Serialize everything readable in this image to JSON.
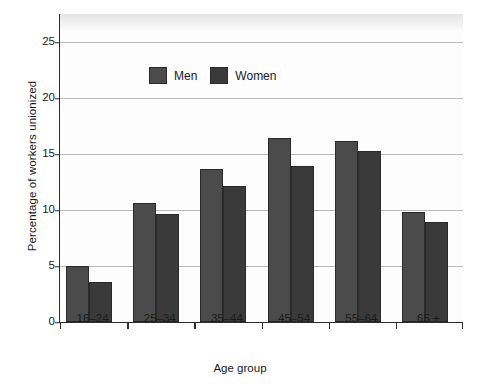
{
  "chart_data": {
    "type": "bar",
    "title": "",
    "xlabel": "Age group",
    "ylabel": "Percentage of workers unionized",
    "categories": [
      "16–24",
      "25–34",
      "35–44",
      "45–54",
      "55–64",
      "65 +"
    ],
    "series": [
      {
        "name": "Men",
        "color": "#4b4b4b",
        "values": [
          5.0,
          10.6,
          13.7,
          16.4,
          16.2,
          9.8
        ]
      },
      {
        "name": "Women",
        "color": "#3a3a3a",
        "values": [
          3.6,
          9.6,
          12.1,
          13.9,
          15.3,
          8.9
        ]
      }
    ],
    "ylim": [
      0,
      27.5
    ],
    "yticks": [
      0,
      5,
      10,
      15,
      20,
      25
    ],
    "ytick_labels": [
      "0",
      "5",
      "10",
      "15",
      "20",
      "25"
    ],
    "grid": "horizontal",
    "legend_position": "top-left-inside"
  }
}
